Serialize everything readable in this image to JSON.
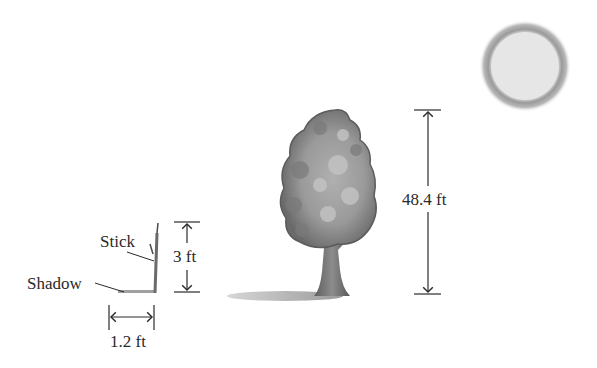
{
  "diagram": {
    "labels": {
      "stick": "Stick",
      "shadow": "Shadow",
      "stick_height": "3 ft",
      "shadow_length": "1.2 ft",
      "tree_height": "48.4 ft"
    },
    "objects": [
      "sun",
      "tree",
      "tree-shadow",
      "stick",
      "stick-shadow"
    ],
    "colors": {
      "ink": "#2a2a2a",
      "sun_fill": "#e6e6e6",
      "sun_halo": "#8a8a8a",
      "foliage_dark": "#6e6e6e",
      "foliage_light": "#a8a8a8",
      "trunk": "#7a7a7a",
      "shadow": "#b5b5b5"
    }
  }
}
